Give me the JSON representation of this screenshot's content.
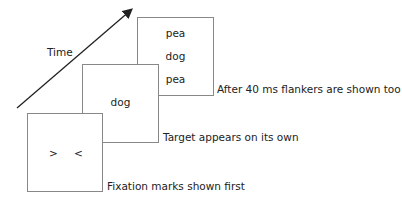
{
  "diagram": {
    "axis_label": "Time",
    "frames": [
      {
        "id": "fixation",
        "content": [
          ">",
          "<"
        ],
        "caption": "Fixation marks shown first"
      },
      {
        "id": "target",
        "content": [
          "dog"
        ],
        "caption": "Target appears on its own"
      },
      {
        "id": "flankers",
        "content": [
          "pea",
          "dog",
          "pea"
        ],
        "caption": "After 40 ms flankers are shown too"
      }
    ],
    "colors": {
      "border": "#888888",
      "text": "#222222",
      "arrow": "#222222"
    }
  }
}
